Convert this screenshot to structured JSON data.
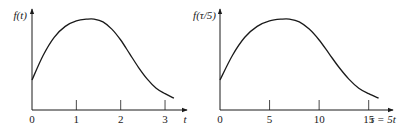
{
  "chart_data": [
    {
      "type": "line",
      "title": "",
      "ylabel": "f(t)",
      "xlabel": "t",
      "xlim": [
        0,
        3.45
      ],
      "ylim": [
        0,
        1.1
      ],
      "xticks": [
        0,
        1,
        2,
        3
      ],
      "xtick_labels": [
        "0",
        "1",
        "2",
        "3"
      ],
      "yticks": [],
      "grid": false,
      "series": [
        {
          "name": "f(t)",
          "x": [
            0,
            0.25,
            0.5,
            0.75,
            1.0,
            1.25,
            1.4,
            1.6,
            1.8,
            2.0,
            2.2,
            2.4,
            2.6,
            2.8,
            3.0,
            3.2
          ],
          "y": [
            0.33,
            0.6,
            0.8,
            0.92,
            0.98,
            1.0,
            1.0,
            0.97,
            0.89,
            0.77,
            0.62,
            0.47,
            0.34,
            0.24,
            0.18,
            0.13
          ]
        }
      ]
    },
    {
      "type": "line",
      "title": "",
      "ylabel": "f(τ/5)",
      "xlabel": "τ = 5t",
      "xlim": [
        0,
        17.25
      ],
      "ylim": [
        0,
        1.1
      ],
      "xticks": [
        0,
        5,
        10,
        15
      ],
      "xtick_labels": [
        "0",
        "5",
        "10",
        "15"
      ],
      "yticks": [],
      "grid": false,
      "series": [
        {
          "name": "f(τ/5)",
          "x": [
            0,
            1.25,
            2.5,
            3.75,
            5,
            6.25,
            7,
            8,
            9,
            10,
            11,
            12,
            13,
            14,
            15,
            16
          ],
          "y": [
            0.33,
            0.6,
            0.8,
            0.92,
            0.98,
            1.0,
            1.0,
            0.97,
            0.89,
            0.77,
            0.62,
            0.47,
            0.34,
            0.24,
            0.18,
            0.13
          ]
        }
      ]
    }
  ]
}
